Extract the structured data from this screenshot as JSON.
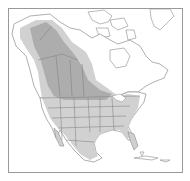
{
  "map": {
    "region": "North America",
    "type": "species range map",
    "colors": {
      "background": "#ffffff",
      "frame": "#9a9a9a",
      "land_outline": "#8c8c8c",
      "range_primary": "#cfcfcf",
      "range_dense": "#a9a9a9",
      "border_lines": "#7a7a7a"
    },
    "legend": []
  }
}
